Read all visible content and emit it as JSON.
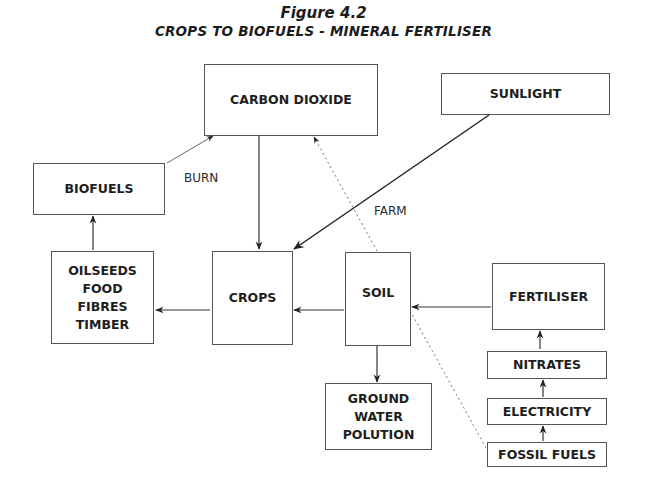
{
  "figure": {
    "number": "Figure 4.2",
    "title": "CROPS TO BIOFUELS - MINERAL FERTILISER"
  },
  "nodes": {
    "carbon_dioxide": "CARBON DIOXIDE",
    "sunlight": "SUNLIGHT",
    "biofuels": "BIOFUELS",
    "products": [
      "OILSEEDS",
      "FOOD",
      "FIBRES",
      "TIMBER"
    ],
    "crops": "CROPS",
    "soil": "SOIL",
    "fertiliser": "FERTILISER",
    "ground_water": [
      "GROUND",
      "WATER",
      "POLUTION"
    ],
    "nitrates": "NITRATES",
    "electricity": "ELECTRICITY",
    "fossil_fuels": "FOSSIL FUELS"
  },
  "edge_labels": {
    "burn": "BURN",
    "farm": "FARM"
  },
  "edges": [
    {
      "from": "biofuels",
      "to": "carbon_dioxide",
      "label": "BURN",
      "style": "solid"
    },
    {
      "from": "carbon_dioxide",
      "to": "crops",
      "style": "solid"
    },
    {
      "from": "sunlight",
      "to": "crops",
      "label": "FARM",
      "style": "solid"
    },
    {
      "from": "crops",
      "to": "products",
      "style": "solid"
    },
    {
      "from": "products",
      "to": "biofuels",
      "style": "solid"
    },
    {
      "from": "soil",
      "to": "crops",
      "style": "solid"
    },
    {
      "from": "fertiliser",
      "to": "soil",
      "style": "solid"
    },
    {
      "from": "soil",
      "to": "ground_water",
      "style": "solid"
    },
    {
      "from": "nitrates",
      "to": "fertiliser",
      "style": "solid"
    },
    {
      "from": "electricity",
      "to": "nitrates",
      "style": "solid"
    },
    {
      "from": "fossil_fuels",
      "to": "electricity",
      "style": "solid"
    },
    {
      "from": "fossil_fuels",
      "to": "carbon_dioxide",
      "style": "dotted"
    }
  ]
}
